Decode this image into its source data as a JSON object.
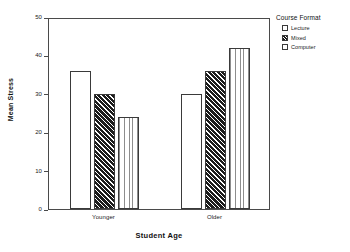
{
  "chart_data": {
    "type": "bar",
    "title": "",
    "xlabel": "Student Age",
    "ylabel": "Mean Stress",
    "categories": [
      "Younger",
      "Older"
    ],
    "series": [
      {
        "name": "Lecture",
        "pattern": "solid-white",
        "values": [
          36,
          30
        ]
      },
      {
        "name": "Mixed",
        "pattern": "diagonal-dark",
        "values": [
          30,
          36
        ]
      },
      {
        "name": "Computer",
        "pattern": "vertical-light",
        "values": [
          24,
          42
        ]
      }
    ],
    "ylim": [
      0,
      50
    ],
    "yticks": [
      0,
      10,
      20,
      30,
      40,
      50
    ],
    "ytick_labels": [
      "0",
      "10",
      "20",
      "30",
      "40",
      "50"
    ],
    "grid": false,
    "legend_position": "right",
    "legend_title": "Course Format",
    "frame": true,
    "colors": {
      "axis": "#4a4a4a",
      "bar_edge": "#3a3a3a",
      "text": "#1a1a1a",
      "background": "#ffffff"
    }
  },
  "legend": {
    "title": "Course Format",
    "items": [
      {
        "label": "Lecture"
      },
      {
        "label": "Mixed"
      },
      {
        "label": "Computer"
      }
    ]
  },
  "axes": {
    "y_title": "Mean Stress",
    "x_title": "Student Age"
  }
}
